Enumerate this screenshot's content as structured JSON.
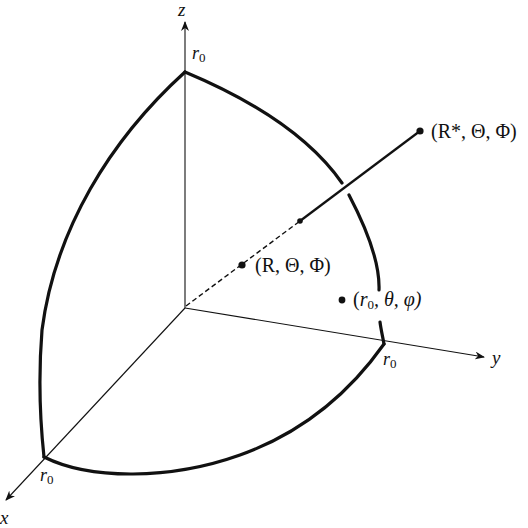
{
  "diagram": {
    "type": "3d-coordinate-sketch",
    "colors": {
      "stroke": "#111111",
      "background": "#ffffff"
    },
    "axes": {
      "x": {
        "label": "x"
      },
      "y": {
        "label": "y"
      },
      "z": {
        "label": "z"
      }
    },
    "radius_labels": {
      "top": {
        "base": "r",
        "sub": "0"
      },
      "right": {
        "base": "r",
        "sub": "0"
      },
      "front": {
        "base": "r",
        "sub": "0"
      }
    },
    "points": [
      {
        "id": "outer",
        "label": "(R*, Θ, Φ)"
      },
      {
        "id": "inner",
        "label": "(R, Θ, Φ)"
      },
      {
        "id": "surface",
        "label_parts": [
          "(",
          "r",
          "0",
          ", θ, φ)"
        ]
      }
    ]
  }
}
